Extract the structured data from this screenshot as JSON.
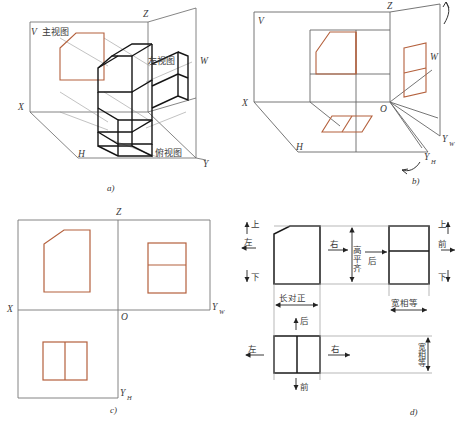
{
  "figure": {
    "accent_color": "#b4603c",
    "line_color": "#555555",
    "solid_color": "#1a1a1a"
  },
  "panels": [
    {
      "key": "a",
      "caption": "a)",
      "description": "三投影面体系与物体的三视图形成",
      "axis_labels": [
        "V",
        "Z",
        "W",
        "X",
        "H",
        "Y"
      ],
      "view_labels": [
        "主视图",
        "左视图",
        "俯视图"
      ]
    },
    {
      "key": "b",
      "caption": "b)",
      "description": "投影面展开",
      "axis_labels": [
        "V",
        "Z",
        "W",
        "X",
        "O",
        "H",
        "YW",
        "YH"
      ],
      "axis_label_yw": "Y",
      "axis_label_yw_sub": "W",
      "axis_label_yh": "Y",
      "axis_label_yh_sub": "H"
    },
    {
      "key": "c",
      "caption": "c)",
      "description": "展开后的三视图配置",
      "axis_labels": [
        "Z",
        "X",
        "O",
        "YW",
        "YH"
      ],
      "axis_label_yw": "Y",
      "axis_label_yw_sub": "W",
      "axis_label_yh": "Y",
      "axis_label_yh_sub": "H"
    },
    {
      "key": "d",
      "caption": "d)",
      "description": "三视图的投影规律与方位关系",
      "rules": [
        "长对正",
        "高平齐",
        "宽相等"
      ],
      "directions": [
        "上",
        "下",
        "左",
        "右",
        "前",
        "后"
      ]
    }
  ],
  "labels_a": {
    "V": "V",
    "Z": "Z",
    "W": "W",
    "X": "X",
    "H": "H",
    "Y": "Y",
    "front_view": "主视图",
    "left_view": "左视图",
    "top_view": "俯视图",
    "caption": "a)"
  },
  "labels_b": {
    "V": "V",
    "Z": "Z",
    "W": "W",
    "X": "X",
    "O": "O",
    "H": "H",
    "Y": "Y",
    "sub_W": "W",
    "sub_H": "H",
    "caption": "b)"
  },
  "labels_c": {
    "Z": "Z",
    "X": "X",
    "O": "O",
    "Y": "Y",
    "sub_W": "W",
    "sub_H": "H",
    "caption": "c)"
  },
  "labels_d": {
    "up": "上",
    "down": "下",
    "left": "左",
    "right": "右",
    "front": "前",
    "back": "后",
    "rule_length": "长对正",
    "rule_height": "高平齐",
    "rule_width": "宽相等",
    "caption": "d)"
  }
}
